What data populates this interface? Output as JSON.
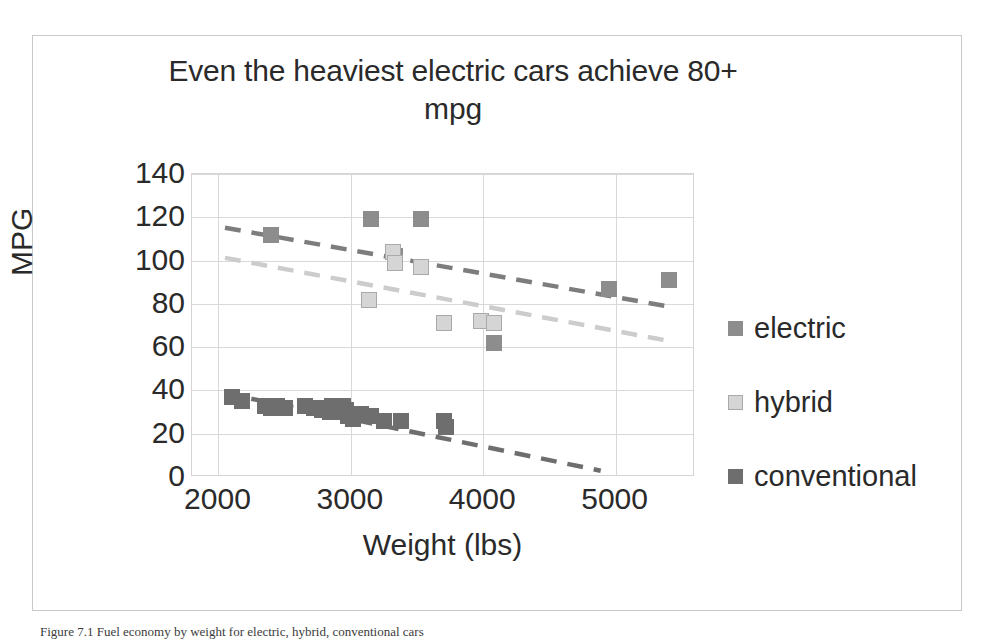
{
  "figure": {
    "caption": "Figure 7.1 Fuel economy by weight for electric, hybrid, conventional cars"
  },
  "chart_data": {
    "type": "scatter",
    "title": "Even the heaviest electric cars achieve 80+ mpg",
    "xlabel": "Weight (lbs)",
    "ylabel": "MPG",
    "xlim": [
      1800,
      5600
    ],
    "ylim": [
      0,
      140
    ],
    "xticks": [
      2000,
      3000,
      4000,
      5000
    ],
    "yticks": [
      0,
      20,
      40,
      60,
      80,
      100,
      120,
      140
    ],
    "grid": true,
    "legend_position": "right",
    "series": [
      {
        "name": "electric",
        "color": "#8d8d8d",
        "points": [
          [
            2400,
            112
          ],
          [
            3150,
            119
          ],
          [
            3530,
            119
          ],
          [
            3330,
            102
          ],
          [
            3700,
            71
          ],
          [
            3980,
            72
          ],
          [
            4080,
            71
          ],
          [
            4080,
            62
          ],
          [
            4950,
            87
          ],
          [
            5400,
            91
          ]
        ],
        "trendline": {
          "color": "#7d7d7d",
          "style": "dashed",
          "x0": 2050,
          "y0": 115,
          "x1": 5450,
          "y1": 78
        }
      },
      {
        "name": "hybrid",
        "color": "#d5d5d5",
        "points": [
          [
            3140,
            82
          ],
          [
            3320,
            104
          ],
          [
            3330,
            99
          ],
          [
            3530,
            97
          ],
          [
            3700,
            71
          ],
          [
            3980,
            72
          ],
          [
            4080,
            71
          ]
        ],
        "trendline": {
          "color": "#cccccc",
          "style": "dashed",
          "x0": 2050,
          "y0": 101,
          "x1": 5450,
          "y1": 62
        }
      },
      {
        "name": "conventional",
        "color": "#6e6e6e",
        "points": [
          [
            2100,
            37
          ],
          [
            2180,
            35
          ],
          [
            2350,
            33
          ],
          [
            2400,
            32
          ],
          [
            2440,
            33
          ],
          [
            2500,
            32
          ],
          [
            2650,
            33
          ],
          [
            2720,
            32
          ],
          [
            2780,
            31
          ],
          [
            2800,
            32
          ],
          [
            2840,
            30
          ],
          [
            2860,
            33
          ],
          [
            2880,
            31
          ],
          [
            2900,
            30
          ],
          [
            2940,
            33
          ],
          [
            2960,
            31
          ],
          [
            2980,
            28
          ],
          [
            3020,
            27
          ],
          [
            3080,
            29
          ],
          [
            3150,
            28
          ],
          [
            3250,
            26
          ],
          [
            3380,
            26
          ],
          [
            3700,
            26
          ],
          [
            3720,
            23
          ]
        ],
        "trendline": {
          "color": "#6e6e6e",
          "style": "dashed",
          "x0": 2050,
          "y0": 38,
          "x1": 4900,
          "y1": 2
        }
      }
    ]
  }
}
